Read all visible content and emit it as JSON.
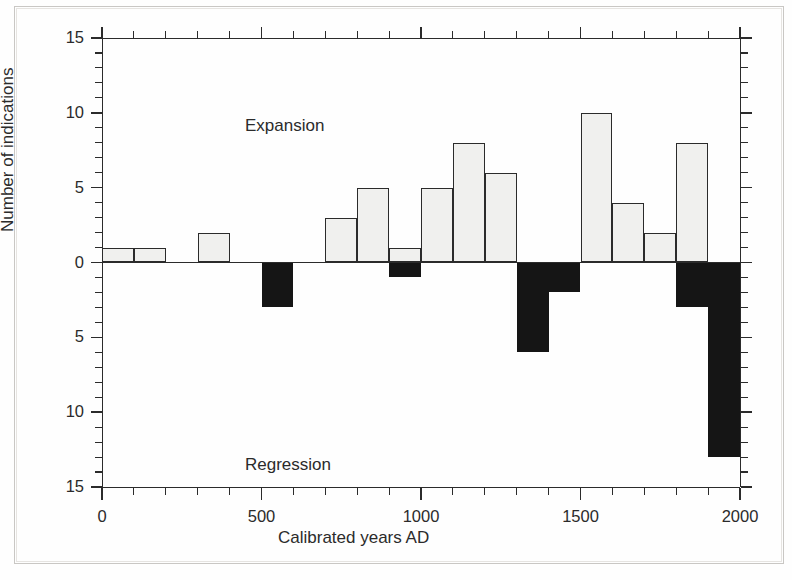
{
  "figure": {
    "background_color": "#fefefe",
    "ink_color": "#2b2b2b"
  },
  "annotations": {
    "expansion_label": "Expansion",
    "regression_label": "Regression"
  },
  "axes": {
    "y_title": "Number of indications",
    "x_title": "Calibrated years AD",
    "y_ticklabels": [
      "15",
      "10",
      "5",
      "0",
      "5",
      "10",
      "15"
    ],
    "x_ticklabels": [
      "0",
      "500",
      "1000",
      "1500",
      "2000"
    ]
  },
  "chart_data": {
    "type": "bar",
    "title": "",
    "subtitle": "",
    "xlabel": "Calibrated years AD",
    "ylabel": "Number of indications",
    "xlim": [
      0,
      2000
    ],
    "ylim": [
      -15,
      15
    ],
    "x_major_ticks": [
      0,
      500,
      1000,
      1500,
      2000
    ],
    "x_minor_tick_step": 100,
    "y_major_ticks": [
      -15,
      -10,
      -5,
      0,
      5,
      10,
      15
    ],
    "y_minor_tick_step": 1,
    "y_tick_display": [
      "15",
      "10",
      "5",
      "0",
      "5",
      "10",
      "15"
    ],
    "grid": false,
    "legend": false,
    "bin_width": 100,
    "annotations": [
      {
        "text": "Expansion",
        "x": 130,
        "y": 12.5
      },
      {
        "text": "Regression",
        "x": 130,
        "y": -11.5
      }
    ],
    "series": [
      {
        "name": "Expansion",
        "color": "#f0f0ee",
        "edge_color": "#2b2b2b",
        "direction": "up",
        "bins": [
          {
            "start": 0,
            "end": 100,
            "value": 1
          },
          {
            "start": 100,
            "end": 200,
            "value": 1
          },
          {
            "start": 200,
            "end": 300,
            "value": 0
          },
          {
            "start": 300,
            "end": 400,
            "value": 2
          },
          {
            "start": 400,
            "end": 500,
            "value": 0
          },
          {
            "start": 500,
            "end": 600,
            "value": 0
          },
          {
            "start": 600,
            "end": 700,
            "value": 0
          },
          {
            "start": 700,
            "end": 800,
            "value": 3
          },
          {
            "start": 800,
            "end": 900,
            "value": 5
          },
          {
            "start": 900,
            "end": 1000,
            "value": 1
          },
          {
            "start": 1000,
            "end": 1100,
            "value": 5
          },
          {
            "start": 1100,
            "end": 1200,
            "value": 8
          },
          {
            "start": 1200,
            "end": 1300,
            "value": 6
          },
          {
            "start": 1300,
            "end": 1400,
            "value": 0
          },
          {
            "start": 1400,
            "end": 1500,
            "value": 0
          },
          {
            "start": 1500,
            "end": 1600,
            "value": 10
          },
          {
            "start": 1600,
            "end": 1700,
            "value": 4
          },
          {
            "start": 1700,
            "end": 1800,
            "value": 2
          },
          {
            "start": 1800,
            "end": 1900,
            "value": 8
          },
          {
            "start": 1900,
            "end": 2000,
            "value": 0
          }
        ]
      },
      {
        "name": "Regression",
        "color": "#151515",
        "edge_color": "#151515",
        "direction": "down",
        "bins": [
          {
            "start": 0,
            "end": 100,
            "value": 0
          },
          {
            "start": 100,
            "end": 200,
            "value": 0
          },
          {
            "start": 200,
            "end": 300,
            "value": 0
          },
          {
            "start": 300,
            "end": 400,
            "value": 0
          },
          {
            "start": 400,
            "end": 500,
            "value": 0
          },
          {
            "start": 500,
            "end": 600,
            "value": -3
          },
          {
            "start": 600,
            "end": 700,
            "value": 0
          },
          {
            "start": 700,
            "end": 800,
            "value": 0
          },
          {
            "start": 800,
            "end": 900,
            "value": 0
          },
          {
            "start": 900,
            "end": 1000,
            "value": -1
          },
          {
            "start": 1000,
            "end": 1100,
            "value": 0
          },
          {
            "start": 1100,
            "end": 1200,
            "value": 0
          },
          {
            "start": 1200,
            "end": 1300,
            "value": 0
          },
          {
            "start": 1300,
            "end": 1400,
            "value": -6
          },
          {
            "start": 1400,
            "end": 1500,
            "value": -2
          },
          {
            "start": 1500,
            "end": 1600,
            "value": 0
          },
          {
            "start": 1600,
            "end": 1700,
            "value": 0
          },
          {
            "start": 1700,
            "end": 1800,
            "value": 0
          },
          {
            "start": 1800,
            "end": 1900,
            "value": -3
          },
          {
            "start": 1900,
            "end": 2000,
            "value": -13
          }
        ]
      }
    ]
  }
}
